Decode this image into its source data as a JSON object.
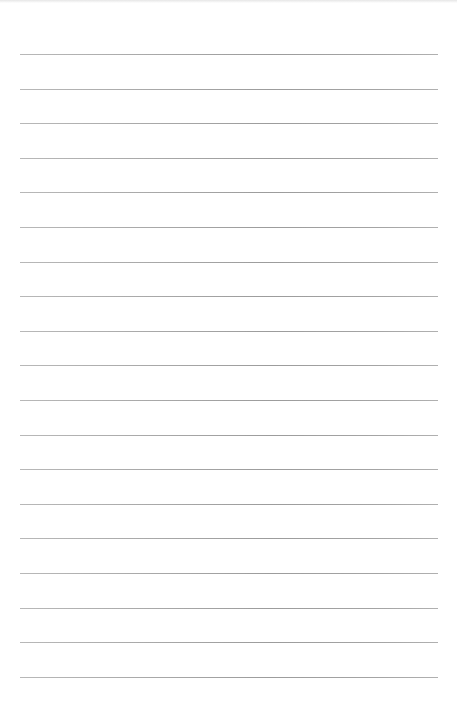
{
  "page": {
    "type": "lined-paper",
    "background": "#ffffff",
    "line_color": "#a6a6a6",
    "line_count": 19,
    "line_left": 20,
    "line_right": 438,
    "first_line_y": 54,
    "line_spacing": 34.6
  }
}
